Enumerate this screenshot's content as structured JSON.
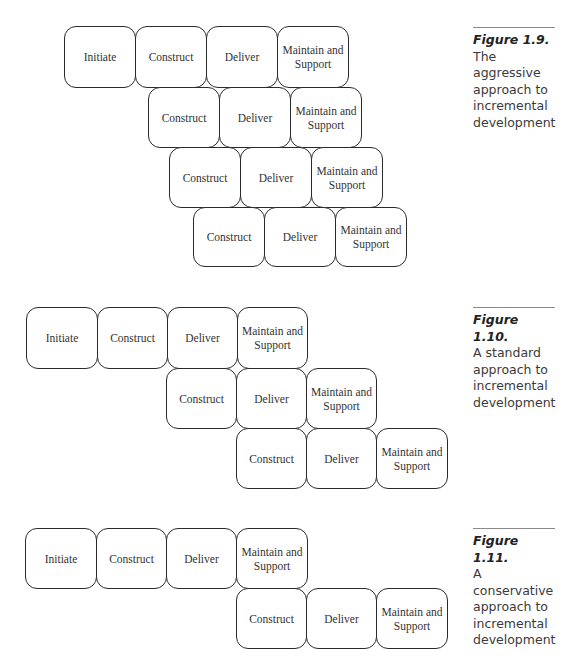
{
  "figures": [
    {
      "caption": {
        "label": "Figure 1.9.",
        "text": "The aggressive approach to incremental development"
      },
      "rows": [
        {
          "y": 26,
          "boxes": [
            {
              "x": 64,
              "label": "Initiate"
            },
            {
              "x": 135,
              "label": "Construct"
            },
            {
              "x": 206,
              "label": "Deliver"
            },
            {
              "x": 277,
              "label": "Maintain and\nSupport"
            }
          ]
        },
        {
          "y": 87,
          "boxes": [
            {
              "x": 148,
              "label": "Construct"
            },
            {
              "x": 219,
              "label": "Deliver"
            },
            {
              "x": 290,
              "label": "Maintain and\nSupport"
            }
          ]
        },
        {
          "y": 147,
          "boxes": [
            {
              "x": 169,
              "label": "Construct"
            },
            {
              "x": 240,
              "label": "Deliver"
            },
            {
              "x": 311,
              "label": "Maintain and\nSupport"
            }
          ]
        },
        {
          "y": 207,
          "boxes": [
            {
              "x": 193,
              "label": "Construct"
            },
            {
              "x": 264,
              "label": "Deliver"
            },
            {
              "x": 335,
              "label": "Maintain and\nSupport"
            }
          ]
        }
      ]
    },
    {
      "caption": {
        "label": "Figure 1.10.",
        "text": "A standard approach to incremental development"
      },
      "rows": [
        {
          "y": 307,
          "boxes": [
            {
              "x": 26,
              "label": "Initiate"
            },
            {
              "x": 97,
              "label": "Construct"
            },
            {
              "x": 167,
              "label": "Deliver"
            },
            {
              "x": 237,
              "label": "Maintain and\nSupport"
            }
          ]
        },
        {
          "y": 368,
          "boxes": [
            {
              "x": 166,
              "label": "Construct"
            },
            {
              "x": 236,
              "label": "Deliver"
            },
            {
              "x": 306,
              "label": "Maintain and\nSupport"
            }
          ]
        },
        {
          "y": 428,
          "boxes": [
            {
              "x": 236,
              "label": "Construct"
            },
            {
              "x": 306,
              "label": "Deliver"
            },
            {
              "x": 376,
              "label": "Maintain and\nSupport"
            }
          ]
        }
      ]
    },
    {
      "caption": {
        "label": "Figure 1.11.",
        "text": "A conservative approach to incremental development"
      },
      "rows": [
        {
          "y": 528,
          "boxes": [
            {
              "x": 25,
              "label": "Initiate"
            },
            {
              "x": 96,
              "label": "Construct"
            },
            {
              "x": 166,
              "label": "Deliver"
            },
            {
              "x": 236,
              "label": "Maintain and\nSupport"
            }
          ]
        },
        {
          "y": 588,
          "boxes": [
            {
              "x": 236,
              "label": "Construct"
            },
            {
              "x": 306,
              "label": "Deliver"
            },
            {
              "x": 376,
              "label": "Maintain and\nSupport"
            }
          ]
        }
      ]
    }
  ]
}
